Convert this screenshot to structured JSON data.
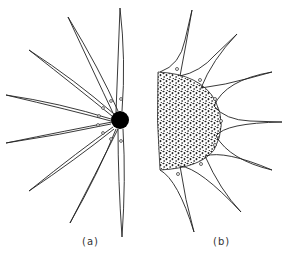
{
  "figure": {
    "panels": [
      {
        "label": "(a)",
        "description": "Point-like node (black dot) with radiating fiber bundles",
        "node": {
          "cx": 120,
          "cy": 120,
          "r": 9,
          "color": "#000000"
        },
        "fiber_ends": [
          [
            120,
            8
          ],
          [
            68,
            17
          ],
          [
            29,
            50
          ],
          [
            6,
            95
          ],
          [
            6,
            143
          ],
          [
            29,
            191
          ],
          [
            70,
            223
          ],
          [
            122,
            237
          ]
        ]
      },
      {
        "label": "(b)",
        "description": "Half-disc stippled cluster with concave webbing to fibers",
        "cluster": {
          "flat_x": 158,
          "top_y": 72,
          "bottom_y": 170,
          "max_x": 222,
          "fill": "stippled"
        },
        "fiber_ends": [
          [
            192,
            10
          ],
          [
            237,
            34
          ],
          [
            272,
            72
          ],
          [
            282,
            122
          ],
          [
            272,
            170
          ],
          [
            241,
            212
          ],
          [
            194,
            232
          ]
        ]
      }
    ],
    "colors": {
      "line": "#222222",
      "background": "#ffffff"
    }
  }
}
